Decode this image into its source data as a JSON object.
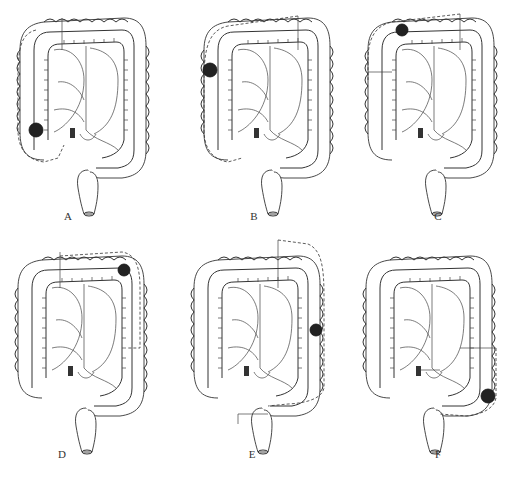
{
  "figure": {
    "panels": [
      {
        "id": "A",
        "label": "A",
        "tumor_location": "cecum / ascending colon (lower right colon)",
        "tumor": {
          "cx": 22,
          "cy": 120
        },
        "resection": "right hemicolectomy"
      },
      {
        "id": "B",
        "label": "B",
        "tumor_location": "hepatic flexure",
        "tumor": {
          "cx": 12,
          "cy": 60
        },
        "resection": "extended right hemicolectomy"
      },
      {
        "id": "C",
        "label": "C",
        "tumor_location": "transverse colon",
        "tumor": {
          "cx": 40,
          "cy": 28
        },
        "resection": "transverse colectomy"
      },
      {
        "id": "D",
        "label": "D",
        "tumor_location": "splenic flexure",
        "tumor": {
          "cx": 112,
          "cy": 32
        },
        "resection": "left hemicolectomy (splenic flexure)"
      },
      {
        "id": "E",
        "label": "E",
        "tumor_location": "descending colon",
        "tumor": {
          "cx": 128,
          "cy": 88
        },
        "resection": "left hemicolectomy"
      },
      {
        "id": "F",
        "label": "F",
        "tumor_location": "sigmoid / descending-sigmoid junction",
        "tumor": {
          "cx": 130,
          "cy": 148
        },
        "resection": "sigmoid colectomy"
      }
    ]
  }
}
